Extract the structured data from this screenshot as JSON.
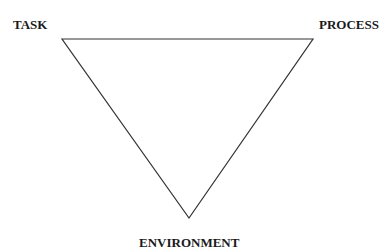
{
  "diagram": {
    "shape": "inverted-triangle",
    "vertices": {
      "top_left": {
        "label": "TASK"
      },
      "top_right": {
        "label": "PROCESS"
      },
      "bottom": {
        "label": "ENVIRONMENT"
      }
    },
    "stroke_color": "#333333",
    "text_color": "#1a1a1a"
  }
}
